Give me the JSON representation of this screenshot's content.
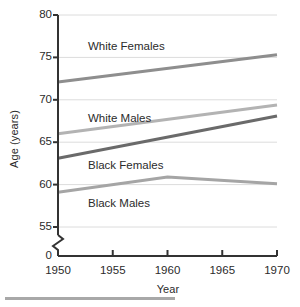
{
  "chart_data": {
    "type": "line",
    "title": "",
    "xlabel": "Year",
    "ylabel": "Age (years)",
    "x": [
      1950,
      1955,
      1960,
      1965,
      1970
    ],
    "xlim": [
      1950,
      1970
    ],
    "ylim": [
      55,
      80
    ],
    "y_axis_break": true,
    "y_zero_tick": "0",
    "xticks": [
      "1950",
      "1955",
      "1960",
      "1965",
      "1970"
    ],
    "yticks": [
      "80",
      "75",
      "70",
      "65",
      "60",
      "55"
    ],
    "grid": true,
    "legend_position": "inline-annotations",
    "series": [
      {
        "name": "White Females",
        "color": "#8e8e8e",
        "label_x": 88,
        "label_y": 40,
        "points": [
          {
            "x": 1950,
            "y": 72.1
          },
          {
            "x": 1970,
            "y": 75.3
          }
        ]
      },
      {
        "name": "White Males",
        "color": "#6a6a6a",
        "label_x": 88,
        "label_y": 112,
        "points": [
          {
            "x": 1950,
            "y": 63.1
          },
          {
            "x": 1970,
            "y": 68.1
          }
        ]
      },
      {
        "name": "Black Females",
        "color": "#b3b3b3",
        "label_x": 88,
        "label_y": 159,
        "points": [
          {
            "x": 1950,
            "y": 66.0
          },
          {
            "x": 1970,
            "y": 69.4
          }
        ]
      },
      {
        "name": "Black Males",
        "color": "#a5a5a5",
        "label_x": 88,
        "label_y": 197,
        "points": [
          {
            "x": 1950,
            "y": 59.1
          },
          {
            "x": 1960,
            "y": 60.9
          },
          {
            "x": 1970,
            "y": 60.1
          }
        ]
      }
    ],
    "annotations": [
      {
        "text": "White Females"
      },
      {
        "text": "White Males"
      },
      {
        "text": "Black Females"
      },
      {
        "text": "Black Males"
      }
    ],
    "colors": {
      "axis": "#333333",
      "gridline": "#dcdcdc",
      "text": "#2b2b2b",
      "bottom_rule": "#a8a8a8"
    }
  }
}
